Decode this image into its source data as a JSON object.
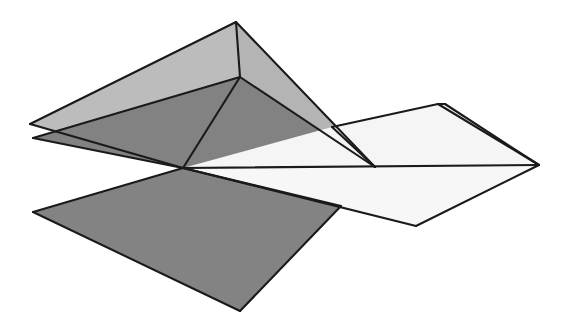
{
  "canvas": {
    "width": 576,
    "height": 333,
    "background": "#ffffff"
  },
  "figure": {
    "stroke_color": "#1a1a1a",
    "stroke_width": 2.1
  },
  "palette": {
    "light_gray": "#b9b9b9",
    "mid_gray": "#9a9a9a",
    "dark_gray": "#7e7e7e",
    "near_white": "#f4f4f4",
    "white": "#fbfbfb",
    "outline": "#1a1a1a",
    "background": "#ffffff"
  },
  "vertices": {
    "left_tip_upper": [
      30,
      124
    ],
    "left_tip_lower": [
      33,
      138
    ],
    "top_apex": [
      236,
      22
    ],
    "mid_apex": [
      240,
      77
    ],
    "center_hub": [
      183,
      168
    ],
    "bottom_left": [
      33,
      212
    ],
    "bottom_apex": [
      240,
      311
    ],
    "bottom_right": [
      341,
      206
    ],
    "white_left": [
      332,
      127
    ],
    "white_top_inner": [
      438,
      104
    ],
    "white_top_outer": [
      445,
      104
    ],
    "right_tip": [
      539,
      165
    ],
    "white_bottom": [
      416,
      226
    ],
    "dark_right_edge": [
      375,
      167
    ]
  },
  "facets": [
    {
      "name": "upper-light-wing-left",
      "fill": "#bcbcbc",
      "points": "30,124 236,22 240,77 183,168"
    },
    {
      "name": "upper-light-wing-right",
      "fill": "#b4b4b4",
      "points": "236,22 375,167 240,77"
    },
    {
      "name": "dark-wing-left",
      "fill": "#828282",
      "points": "33,138 240,77 183,168"
    },
    {
      "name": "dark-wing-right",
      "fill": "#828282",
      "points": "240,77 375,167 183,168"
    },
    {
      "name": "dark-lower-wing",
      "fill": "#838383",
      "points": "33,212 183,168 341,206 240,311"
    },
    {
      "name": "white-upper-panel",
      "fill": "#f5f5f5",
      "points": "332,127 438,104 539,165 183,168"
    },
    {
      "name": "white-sliver",
      "fill": "#fbfbfb",
      "points": "438,104 445,104 539,165"
    },
    {
      "name": "white-lower-panel",
      "fill": "#f7f7f7",
      "points": "183,168 539,165 416,226"
    }
  ],
  "edges": [
    {
      "name": "edge-left-upper-to-apex",
      "points": "30,124 236,22"
    },
    {
      "name": "edge-apex-to-midapex",
      "points": "236,22 240,77"
    },
    {
      "name": "edge-apex-to-darkright",
      "points": "236,22 375,167"
    },
    {
      "name": "edge-lefttip-upper-to-hub",
      "points": "30,124 183,168"
    },
    {
      "name": "edge-lefttip-lower-to-midapex",
      "points": "33,138 240,77"
    },
    {
      "name": "edge-lefttip-lower-to-hub",
      "points": "33,138 183,168"
    },
    {
      "name": "edge-midapex-to-hub",
      "points": "240,77 183,168"
    },
    {
      "name": "edge-midapex-to-darkright",
      "points": "240,77 375,167"
    },
    {
      "name": "edge-hub-to-bottomleft",
      "points": "183,168 33,212"
    },
    {
      "name": "edge-bottomleft-to-bottomapex",
      "points": "33,212 240,311"
    },
    {
      "name": "edge-bottomapex-to-bottomright",
      "points": "240,311 341,206"
    },
    {
      "name": "edge-bottomright-to-hub",
      "points": "341,206 183,168"
    },
    {
      "name": "edge-whiteleft-to-whitetop",
      "points": "332,127 438,104"
    },
    {
      "name": "edge-whitetop-to-righttip",
      "points": "438,104 539,165"
    },
    {
      "name": "edge-whitetop-outer-to-righttip",
      "points": "445,104 539,165"
    },
    {
      "name": "edge-whitetop-inner-outer",
      "points": "438,104 445,104"
    },
    {
      "name": "edge-hub-to-righttip",
      "points": "183,168 539,165"
    },
    {
      "name": "edge-righttip-to-whitebottom",
      "points": "539,165 416,226"
    },
    {
      "name": "edge-whitebottom-to-hub",
      "points": "416,226 183,168"
    },
    {
      "name": "edge-whiteleft-down",
      "points": "332,127 375,167"
    }
  ]
}
